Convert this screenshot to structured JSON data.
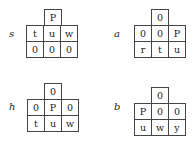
{
  "panels": [
    {
      "label": "s",
      "top": "P",
      "middle": [
        "t",
        "u",
        "w"
      ],
      "bottom": [
        "0",
        "0",
        "0"
      ]
    },
    {
      "label": "a",
      "top": "0",
      "middle": [
        "0",
        "0",
        "P"
      ],
      "bottom": [
        "r",
        "t",
        "u"
      ]
    },
    {
      "label": "h",
      "top": "0",
      "middle": [
        "0",
        "P",
        "0"
      ],
      "bottom": [
        "t",
        "u",
        "w"
      ]
    },
    {
      "label": "b",
      "top": "0",
      "middle": [
        "P",
        "0",
        "0"
      ],
      "bottom": [
        "u",
        "w",
        "y"
      ]
    }
  ]
}
